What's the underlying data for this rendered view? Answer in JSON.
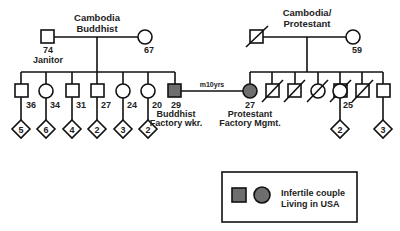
{
  "diagram": {
    "type": "pedigree",
    "left_family": {
      "origin_label_1": "Cambodia",
      "origin_label_2": "Buddhist",
      "father": {
        "symbol": "square",
        "age": "74",
        "occupation": "Janitor"
      },
      "mother": {
        "symbol": "circle",
        "age": "67"
      },
      "children": [
        {
          "symbol": "square",
          "age": "36",
          "offspring": "5"
        },
        {
          "symbol": "circle",
          "age": "34",
          "offspring": "6"
        },
        {
          "symbol": "square",
          "age": "31",
          "offspring": "4"
        },
        {
          "symbol": "square",
          "age": "27",
          "offspring": "2"
        },
        {
          "symbol": "circle",
          "age": "24",
          "offspring": "3"
        },
        {
          "symbol": "circle",
          "age": "20",
          "offspring": "2"
        }
      ]
    },
    "right_family": {
      "origin_label_1": "Cambodia/",
      "origin_label_2": "Protestant",
      "father": {
        "symbol": "square",
        "deceased": true
      },
      "mother": {
        "symbol": "circle",
        "age": "59"
      },
      "children": [
        {
          "symbol": "square",
          "deceased": true
        },
        {
          "symbol": "square",
          "deceased": true
        },
        {
          "symbol": "circle",
          "deceased": true
        },
        {
          "symbol": "square",
          "deceased": true
        },
        {
          "symbol": "circle",
          "age": "25",
          "offspring": "2"
        },
        {
          "symbol": "square",
          "deceased": true
        },
        {
          "symbol": "square",
          "offspring": "3"
        }
      ]
    },
    "couple": {
      "husband": {
        "age": "29",
        "religion": "Buddhist",
        "occupation": "Factory wkr."
      },
      "wife": {
        "age": "27",
        "religion": "Protestant",
        "occupation": "Factory Mgmt."
      },
      "marriage_label": "m10yrs"
    },
    "legend": {
      "line1": "Infertile couple",
      "line2": "Living in USA",
      "fill_color": "#6e6e6e"
    }
  }
}
